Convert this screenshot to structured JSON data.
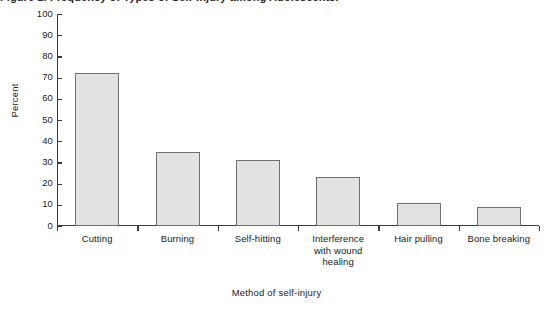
{
  "figure": {
    "caption_cutoff": "Figure 1. Frequency of Types of Self-Injury among Adolescents.",
    "ylabel": "Percent",
    "xlabel": "Method of self-injury"
  },
  "chart_data": {
    "type": "bar",
    "title": "",
    "xlabel": "Method of self-injury",
    "ylabel": "Percent",
    "categories": [
      "Cutting",
      "Burning",
      "Self-hitting",
      "Interference\nwith wound\nhealing",
      "Hair pulling",
      "Bone breaking"
    ],
    "category_lines": [
      [
        "Cutting"
      ],
      [
        "Burning"
      ],
      [
        "Self-hitting"
      ],
      [
        "Interference",
        "with wound",
        "healing"
      ],
      [
        "Hair pulling"
      ],
      [
        "Bone breaking"
      ]
    ],
    "values": [
      72,
      35,
      31,
      23,
      11,
      9
    ],
    "ylim": [
      0,
      100
    ],
    "yticks": [
      0,
      10,
      20,
      30,
      40,
      50,
      60,
      70,
      80,
      90,
      100
    ],
    "ytick_labels": [
      "0",
      "10",
      "20",
      "30",
      "40",
      "50",
      "60",
      "70",
      "80",
      "90",
      "100"
    ],
    "grid": false,
    "legend": "none",
    "bar_fill": "#e2e2e2",
    "bar_edge": "#6f6f6f",
    "axis_color": "#3a3a3a"
  }
}
